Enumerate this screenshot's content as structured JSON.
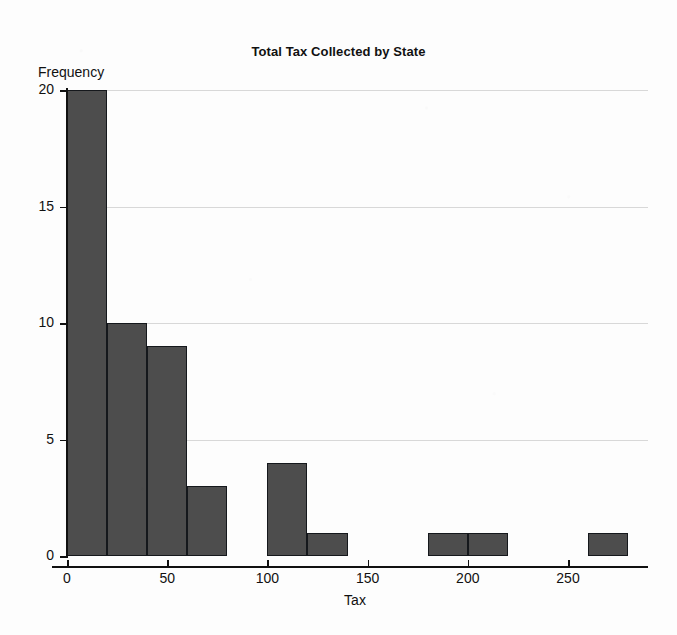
{
  "chart_data": {
    "type": "bar",
    "title": "Total Tax Collected by State",
    "xlabel": "Tax",
    "ylabel": "Frequency",
    "grid": true,
    "legend": "none",
    "bin_width": 20,
    "xlim": [
      0,
      290
    ],
    "ylim": [
      0,
      20
    ],
    "xticks": [
      0,
      50,
      100,
      150,
      200,
      250
    ],
    "yticks": [
      0,
      5,
      10,
      15,
      20
    ],
    "categories": [
      "0-20",
      "20-40",
      "40-60",
      "60-80",
      "80-100",
      "100-120",
      "120-140",
      "140-160",
      "160-180",
      "180-200",
      "200-220",
      "220-240",
      "240-260",
      "260-280"
    ],
    "bins": [
      {
        "start": 0,
        "end": 20,
        "value": 20
      },
      {
        "start": 20,
        "end": 40,
        "value": 10
      },
      {
        "start": 40,
        "end": 60,
        "value": 9
      },
      {
        "start": 60,
        "end": 80,
        "value": 3
      },
      {
        "start": 80,
        "end": 100,
        "value": 0
      },
      {
        "start": 100,
        "end": 120,
        "value": 4
      },
      {
        "start": 120,
        "end": 140,
        "value": 1
      },
      {
        "start": 140,
        "end": 160,
        "value": 0
      },
      {
        "start": 160,
        "end": 180,
        "value": 0
      },
      {
        "start": 180,
        "end": 200,
        "value": 1
      },
      {
        "start": 200,
        "end": 220,
        "value": 1
      },
      {
        "start": 220,
        "end": 240,
        "value": 0
      },
      {
        "start": 240,
        "end": 260,
        "value": 0
      },
      {
        "start": 260,
        "end": 280,
        "value": 1
      }
    ],
    "values": [
      20,
      10,
      9,
      3,
      0,
      4,
      1,
      0,
      0,
      1,
      1,
      0,
      0,
      1
    ],
    "colors": {
      "bar_fill": "#4d4d4d",
      "bar_edge": "#15181c",
      "axis": "#111111",
      "gridline": "#d8d8d8",
      "background": "#fdfdfd"
    }
  }
}
